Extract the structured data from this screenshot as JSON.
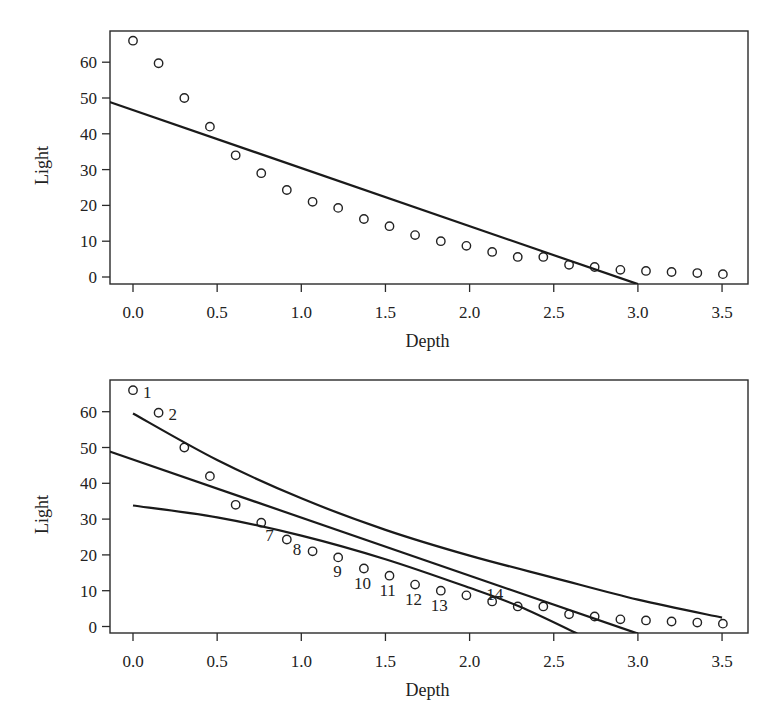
{
  "chart_data": [
    {
      "type": "scatter",
      "panel": "top",
      "title": "",
      "xlabel": "Depth",
      "ylabel": "Light",
      "xlim": [
        -0.14,
        3.64
      ],
      "ylim": [
        -2,
        68
      ],
      "xticks": [
        0.0,
        0.5,
        1.0,
        1.5,
        2.0,
        2.5,
        3.0,
        3.5
      ],
      "xtick_labels": [
        "0.0",
        "0.5",
        "1.0",
        "1.5",
        "2.0",
        "2.5",
        "3.0",
        "3.5"
      ],
      "yticks": [
        0,
        10,
        20,
        30,
        40,
        50,
        60
      ],
      "ytick_labels": [
        "0",
        "10",
        "20",
        "30",
        "40",
        "50",
        "60"
      ],
      "grid": false,
      "legend": null,
      "series": [
        {
          "name": "observed",
          "kind": "points",
          "marker": "open-circle",
          "x": [
            0.0,
            0.152,
            0.305,
            0.457,
            0.61,
            0.762,
            0.914,
            1.067,
            1.219,
            1.372,
            1.524,
            1.676,
            1.829,
            1.981,
            2.134,
            2.286,
            2.438,
            2.591,
            2.743,
            2.896,
            3.048,
            3.2,
            3.353,
            3.505
          ],
          "y": [
            66.0,
            59.7,
            50.0,
            42.0,
            34.0,
            29.0,
            24.3,
            21.0,
            19.3,
            16.2,
            14.2,
            11.7,
            10.0,
            8.7,
            7.0,
            5.6,
            5.6,
            3.4,
            2.8,
            2.0,
            1.7,
            1.4,
            1.1,
            0.8
          ]
        },
        {
          "name": "linear fit",
          "kind": "line",
          "x": [
            -0.14,
            3.0
          ],
          "y": [
            48.9,
            -2.0
          ]
        }
      ]
    },
    {
      "type": "scatter",
      "panel": "bottom",
      "title": "",
      "xlabel": "Depth",
      "ylabel": "Light",
      "xlim": [
        -0.14,
        3.64
      ],
      "ylim": [
        -2,
        68
      ],
      "xticks": [
        0.0,
        0.5,
        1.0,
        1.5,
        2.0,
        2.5,
        3.0,
        3.5
      ],
      "xtick_labels": [
        "0.0",
        "0.5",
        "1.0",
        "1.5",
        "2.0",
        "2.5",
        "3.0",
        "3.5"
      ],
      "yticks": [
        0,
        10,
        20,
        30,
        40,
        50,
        60
      ],
      "ytick_labels": [
        "0",
        "10",
        "20",
        "30",
        "40",
        "50",
        "60"
      ],
      "grid": false,
      "legend": null,
      "series": [
        {
          "name": "observed",
          "kind": "points",
          "marker": "open-circle",
          "x": [
            0.0,
            0.152,
            0.305,
            0.457,
            0.61,
            0.762,
            0.914,
            1.067,
            1.219,
            1.372,
            1.524,
            1.676,
            1.829,
            1.981,
            2.134,
            2.286,
            2.438,
            2.591,
            2.743,
            2.896,
            3.048,
            3.2,
            3.353,
            3.505
          ],
          "y": [
            66.0,
            59.7,
            50.0,
            42.0,
            34.0,
            29.0,
            24.3,
            21.0,
            19.3,
            16.2,
            14.2,
            11.7,
            10.0,
            8.7,
            7.0,
            5.6,
            5.6,
            3.4,
            2.8,
            2.0,
            1.7,
            1.4,
            1.1,
            0.8
          ]
        },
        {
          "name": "linear fit",
          "kind": "line",
          "x": [
            -0.14,
            3.0
          ],
          "y": [
            48.9,
            -2.0
          ]
        },
        {
          "name": "upper band",
          "kind": "curve",
          "x": [
            0.0,
            0.5,
            1.0,
            1.5,
            2.0,
            2.5,
            3.0,
            3.5
          ],
          "y": [
            59.5,
            46.5,
            35.8,
            27.0,
            19.8,
            13.6,
            7.5,
            2.5
          ]
        },
        {
          "name": "lower band",
          "kind": "curve",
          "x": [
            0.0,
            0.5,
            1.0,
            1.5,
            2.0,
            2.3,
            2.64
          ],
          "y": [
            33.8,
            30.5,
            25.4,
            18.8,
            10.8,
            5.5,
            -2.0
          ]
        }
      ],
      "annotations": [
        {
          "text": "1",
          "index": 0,
          "dx": 10,
          "dy": 8
        },
        {
          "text": "2",
          "index": 1,
          "dx": 10,
          "dy": 7
        },
        {
          "text": "7",
          "index": 5,
          "dx": 4,
          "dy": 18
        },
        {
          "text": "8",
          "index": 6,
          "dx": 6,
          "dy": 15
        },
        {
          "text": "9",
          "index": 8,
          "dx": -5,
          "dy": 20
        },
        {
          "text": "10",
          "index": 9,
          "dx": -10,
          "dy": 20
        },
        {
          "text": "11",
          "index": 10,
          "dx": -10,
          "dy": 20
        },
        {
          "text": "12",
          "index": 11,
          "dx": -10,
          "dy": 20
        },
        {
          "text": "13",
          "index": 12,
          "dx": -10,
          "dy": 20
        },
        {
          "text": "14",
          "index": 14,
          "dx": -6,
          "dy": -1
        }
      ]
    }
  ],
  "panels": {
    "top": {
      "xlabel": "Depth",
      "ylabel": "Light"
    },
    "bottom": {
      "xlabel": "Depth",
      "ylabel": "Light"
    }
  }
}
